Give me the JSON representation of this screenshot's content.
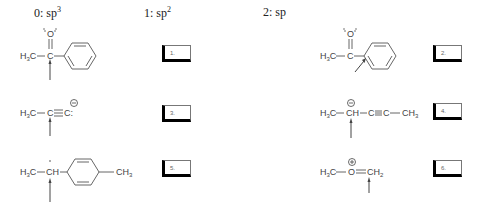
{
  "legend": [
    {
      "index": "0",
      "label": "sp",
      "sup": "3"
    },
    {
      "index": "1",
      "label": "sp",
      "sup": "2"
    },
    {
      "index": "2",
      "label": "sp",
      "sup": ""
    }
  ],
  "answer_boxes": [
    {
      "number": "1.",
      "value": ""
    },
    {
      "number": "2.",
      "value": ""
    },
    {
      "number": "3.",
      "value": ""
    },
    {
      "number": "4.",
      "value": ""
    },
    {
      "number": "5.",
      "value": ""
    },
    {
      "number": "6.",
      "value": ""
    }
  ],
  "molecules": {
    "m1": {
      "h3c": "H",
      "h3c_sub": "3",
      "h3c_c": "C",
      "carbon": "C",
      "oxygen": "O"
    },
    "m2": {
      "h3c": "H",
      "h3c_sub": "3",
      "h3c_c": "C",
      "carbon": "C",
      "oxygen": "O"
    },
    "m3": {
      "h3c": "H",
      "h3c_sub": "3",
      "h3c_c": "C",
      "c1": "C",
      "c2": "C:",
      "charge": "−"
    },
    "m4": {
      "h3c": "H",
      "h3c_sub": "3",
      "h3c_c": "C",
      "ch": "CH",
      "c1": "C",
      "c2": "C",
      "ch3": "CH",
      "ch3_sub": "3",
      "charge": "−"
    },
    "m5": {
      "h3c": "H",
      "h3c_sub": "3",
      "h3c_c": "C",
      "ch": "CH",
      "ch3": "CH",
      "ch3_sub": "3"
    },
    "m6": {
      "h3c": "H",
      "h3c_sub": "3",
      "h3c_c": "C",
      "oxygen": "O",
      "ch2": "CH",
      "ch2_sub": "2",
      "charge": "+"
    }
  }
}
